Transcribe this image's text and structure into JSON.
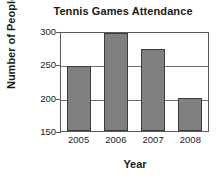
{
  "chart_data": {
    "type": "bar",
    "title": "Tennis Games Attendance",
    "xlabel": "Year",
    "ylabel": "Number of People",
    "categories": [
      "2005",
      "2006",
      "2007",
      "2008"
    ],
    "values": [
      250,
      300,
      275,
      200
    ],
    "ylim": [
      150,
      300
    ],
    "yticks": [
      150,
      200,
      250,
      300
    ],
    "ytick_labels": [
      "150",
      "200",
      "250",
      "300"
    ],
    "grid": true,
    "legend": "none",
    "bar_color": "#808080",
    "bar_edge_color": "#3c3c3c",
    "axis_color": "#5a5a5a",
    "background_color": "#ffffff",
    "text_color": "#1a1a1a"
  }
}
